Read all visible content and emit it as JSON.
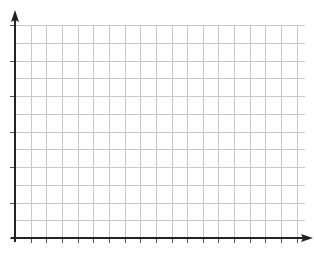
{
  "figure": {
    "cut_off_text_top": "",
    "grid": {
      "origin_px": [
        15,
        238
      ],
      "cols": 18,
      "rows": 12,
      "col_spacing_px": 15.65,
      "row_spacing_px": 17.75,
      "grid_right_px": 305,
      "grid_top_px": 25,
      "grid_color": "#c8c8c8",
      "axis_color": "#222222"
    },
    "x_axis": {
      "label": "",
      "tick_every_col": 1,
      "arrow": true,
      "end_px": 313
    },
    "y_axis": {
      "label": "",
      "tick_every_row": 2,
      "arrow": true,
      "end_px": 10
    }
  }
}
